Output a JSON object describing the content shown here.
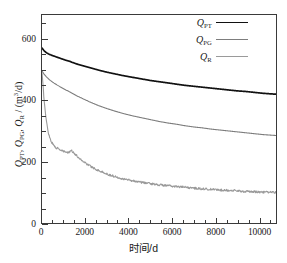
{
  "chart_data": {
    "type": "line",
    "title": "",
    "xlabel": "时间/d",
    "ylabel": "Q_PT, Q_PG, Q_R / (m³/d)",
    "ylabel_parts": {
      "q1": "Q",
      "q1sub": "PT",
      "sep1": ", ",
      "q2": "Q",
      "q2sub": "PG",
      "sep2": ", ",
      "q3": "Q",
      "q3sub": "R",
      "unit_pre": " / (m",
      "unit_sup": "3",
      "unit_post": "/d)"
    },
    "xlim": [
      0,
      10800
    ],
    "ylim": [
      0,
      680
    ],
    "xticks": [
      0,
      2000,
      4000,
      6000,
      8000,
      10000
    ],
    "xtick_labels": [
      "0",
      "2000",
      "4000",
      "6000",
      "8000",
      "10000"
    ],
    "xminor_step": 500,
    "yticks": [
      0,
      200,
      400,
      600
    ],
    "ytick_labels": [
      "0",
      "200",
      "400",
      "600"
    ],
    "yminor_step": 50,
    "grid": false,
    "legend_position": "top-right",
    "series": [
      {
        "name": "Q_PT",
        "label_base": "Q",
        "label_sub": "PT",
        "color": "#111111",
        "width": 1.7,
        "noise": 0,
        "x": [
          0,
          100,
          200,
          350,
          500,
          700,
          900,
          1100,
          1300,
          1400,
          1600,
          1900,
          2200,
          2600,
          3000,
          3400,
          3800,
          4200,
          4600,
          5000,
          5400,
          5800,
          6200,
          6600,
          7000,
          7400,
          7800,
          8200,
          8600,
          9000,
          9400,
          9800,
          10200,
          10600,
          10800
        ],
        "y": [
          572,
          563,
          557,
          551,
          547,
          542,
          537,
          532,
          528,
          525,
          520,
          514,
          508,
          500,
          493,
          487,
          481,
          476,
          471,
          466,
          462,
          458,
          454,
          450,
          447,
          444,
          441,
          438,
          435,
          432,
          430,
          427,
          424,
          422,
          421
        ]
      },
      {
        "name": "Q_PG",
        "label_base": "Q",
        "label_sub": "PG",
        "color": "#7d7d7d",
        "width": 1.1,
        "noise": 0,
        "x": [
          0,
          100,
          200,
          350,
          500,
          700,
          900,
          1100,
          1300,
          1400,
          1600,
          1900,
          2200,
          2600,
          3000,
          3400,
          3800,
          4200,
          4600,
          5000,
          5400,
          5800,
          6200,
          6600,
          7000,
          7400,
          7800,
          8200,
          8600,
          9000,
          9400,
          9800,
          10200,
          10600,
          10800
        ],
        "y": [
          497,
          486,
          478,
          468,
          460,
          451,
          443,
          435,
          428,
          424,
          416,
          406,
          396,
          384,
          374,
          365,
          357,
          350,
          344,
          338,
          332,
          327,
          323,
          318,
          314,
          311,
          307,
          304,
          301,
          298,
          295,
          292,
          289,
          287,
          286
        ]
      },
      {
        "name": "Q_R",
        "label_base": "Q",
        "label_sub": "R",
        "color": "#9a9a9a",
        "width": 1.1,
        "noise": 3.5,
        "x": [
          0,
          40,
          80,
          130,
          190,
          260,
          340,
          430,
          540,
          660,
          800,
          950,
          1100,
          1250,
          1320,
          1380,
          1500,
          1700,
          1950,
          2250,
          2600,
          3000,
          3400,
          3800,
          4200,
          4600,
          5000,
          5400,
          5800,
          6200,
          6600,
          7000,
          7400,
          7800,
          8200,
          8600,
          9000,
          9400,
          9800,
          10200,
          10600,
          10800
        ],
        "y": [
          490,
          456,
          418,
          378,
          340,
          307,
          283,
          266,
          254,
          246,
          240,
          235,
          232,
          229,
          240,
          236,
          227,
          213,
          199,
          185,
          172,
          160,
          151,
          144,
          138,
          133,
          129,
          125,
          122,
          119,
          117,
          114,
          112,
          110,
          108,
          107,
          105,
          103,
          102,
          101,
          100,
          100
        ]
      }
    ]
  }
}
